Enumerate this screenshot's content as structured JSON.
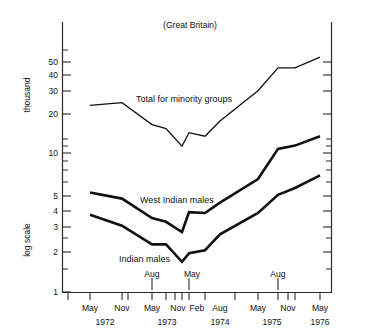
{
  "chart_data": {
    "type": "line",
    "title": "(Great Britain)",
    "xlabel": "",
    "ylabel": "thousand",
    "ylabel_secondary": "log scale",
    "scale": "log",
    "grid": false,
    "legend_position": "inline-annotations",
    "ylim": [
      1,
      60
    ],
    "y_ticks": [
      1,
      2,
      3,
      4,
      5,
      10,
      20,
      30,
      40,
      50
    ],
    "y_tick_labels": [
      "1",
      "2",
      "3",
      "4",
      "5",
      "10",
      "20",
      "30",
      "40",
      "50"
    ],
    "x_tick_labels": [
      "May",
      "Nov",
      "May",
      "Nov",
      "Feb",
      "May",
      "Aug",
      "May",
      "Nov",
      "May"
    ],
    "x_year_labels": [
      "1972",
      "1973",
      "1974",
      "1975",
      "1976"
    ],
    "x_callouts": [
      "Aug",
      "May",
      "Aug"
    ],
    "x": [
      "May 1972",
      "Nov 1972",
      "May 1973",
      "Aug 1973",
      "Nov 1973",
      "Feb 1974",
      "May 1974",
      "Aug 1974",
      "May 1975",
      "Aug 1975",
      "Nov 1975",
      "May 1976"
    ],
    "series": [
      {
        "name": "Total for minority groups",
        "values": [
          22,
          23,
          16,
          15,
          11.2,
          14,
          13.2,
          17,
          28,
          41,
          41,
          49
        ]
      },
      {
        "name": "West Indian males",
        "values": [
          5.2,
          4.7,
          3.4,
          3.2,
          2.7,
          3.75,
          3.7,
          4.4,
          6.5,
          10.7,
          11.3,
          13.2
        ]
      },
      {
        "name": "Indian males",
        "values": [
          3.6,
          3.0,
          2.2,
          2.2,
          1.65,
          1.9,
          2.0,
          2.6,
          3.7,
          5.0,
          5.6,
          6.9
        ]
      }
    ]
  },
  "annotations": {
    "title": "(Great Britain)",
    "y_axis_upper": "thousand",
    "y_axis_lower": "log scale",
    "series_labels": {
      "total": "Total for minority groups",
      "west_indian": "West Indian males",
      "indian": "Indian males"
    },
    "callout_aug_1973": "Aug",
    "callout_may_1974": "May",
    "callout_aug_1975": "Aug"
  },
  "y_ticks": {
    "t50": "50",
    "t40": "40",
    "t30": "30",
    "t20": "20",
    "t10": "10",
    "t5": "5",
    "t4": "4",
    "t3": "3",
    "t2": "2",
    "t1": "1"
  },
  "x_ticks": {
    "may1972": "May",
    "nov1972": "Nov",
    "may1973": "May",
    "nov1973": "Nov",
    "feb1974": "Feb",
    "may1974": "Aug",
    "may1975": "May",
    "nov1975": "Nov",
    "may1976": "May"
  },
  "x_axis": {
    "labels": [
      "May",
      "Nov",
      "May",
      "Nov",
      "Feb",
      "Aug",
      "May",
      "Nov",
      "May"
    ],
    "years": [
      "1972",
      "1973",
      "1974",
      "1975",
      "1976"
    ]
  }
}
